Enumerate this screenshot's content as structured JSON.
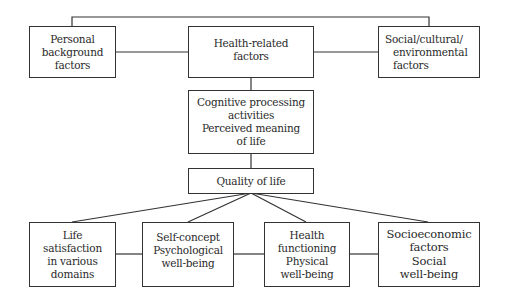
{
  "diagram": {
    "type": "flowchart",
    "nodes": {
      "personal": {
        "lines": [
          "Personal",
          "background",
          "factors"
        ]
      },
      "health_related": {
        "lines": [
          "Health-related",
          "factors"
        ]
      },
      "social_cultural": {
        "lines": [
          "Social/cultural/",
          "environmental",
          "factors"
        ]
      },
      "cognitive": {
        "lines": [
          "Cognitive processing",
          "activities",
          "Perceived meaning",
          "of life"
        ]
      },
      "quality": {
        "lines": [
          "Quality of life"
        ]
      },
      "life_satisfaction": {
        "lines": [
          "Life",
          "satisfaction",
          "in various",
          "domains"
        ]
      },
      "self_concept": {
        "lines": [
          "Self-concept",
          "Psychological",
          "well-being"
        ]
      },
      "health_functioning": {
        "lines": [
          "Health",
          "functioning",
          "Physical",
          "well-being"
        ]
      },
      "socioeconomic": {
        "lines": [
          "Socioeconomic",
          "factors",
          "Social",
          "well-being"
        ]
      }
    },
    "edges": [
      [
        "personal",
        "health_related"
      ],
      [
        "health_related",
        "social_cultural"
      ],
      [
        "personal",
        "social_cultural"
      ],
      [
        "health_related",
        "cognitive"
      ],
      [
        "cognitive",
        "quality"
      ],
      [
        "quality",
        "life_satisfaction"
      ],
      [
        "quality",
        "self_concept"
      ],
      [
        "quality",
        "health_functioning"
      ],
      [
        "quality",
        "socioeconomic"
      ],
      [
        "life_satisfaction",
        "self_concept"
      ],
      [
        "self_concept",
        "health_functioning"
      ],
      [
        "health_functioning",
        "socioeconomic"
      ]
    ]
  }
}
